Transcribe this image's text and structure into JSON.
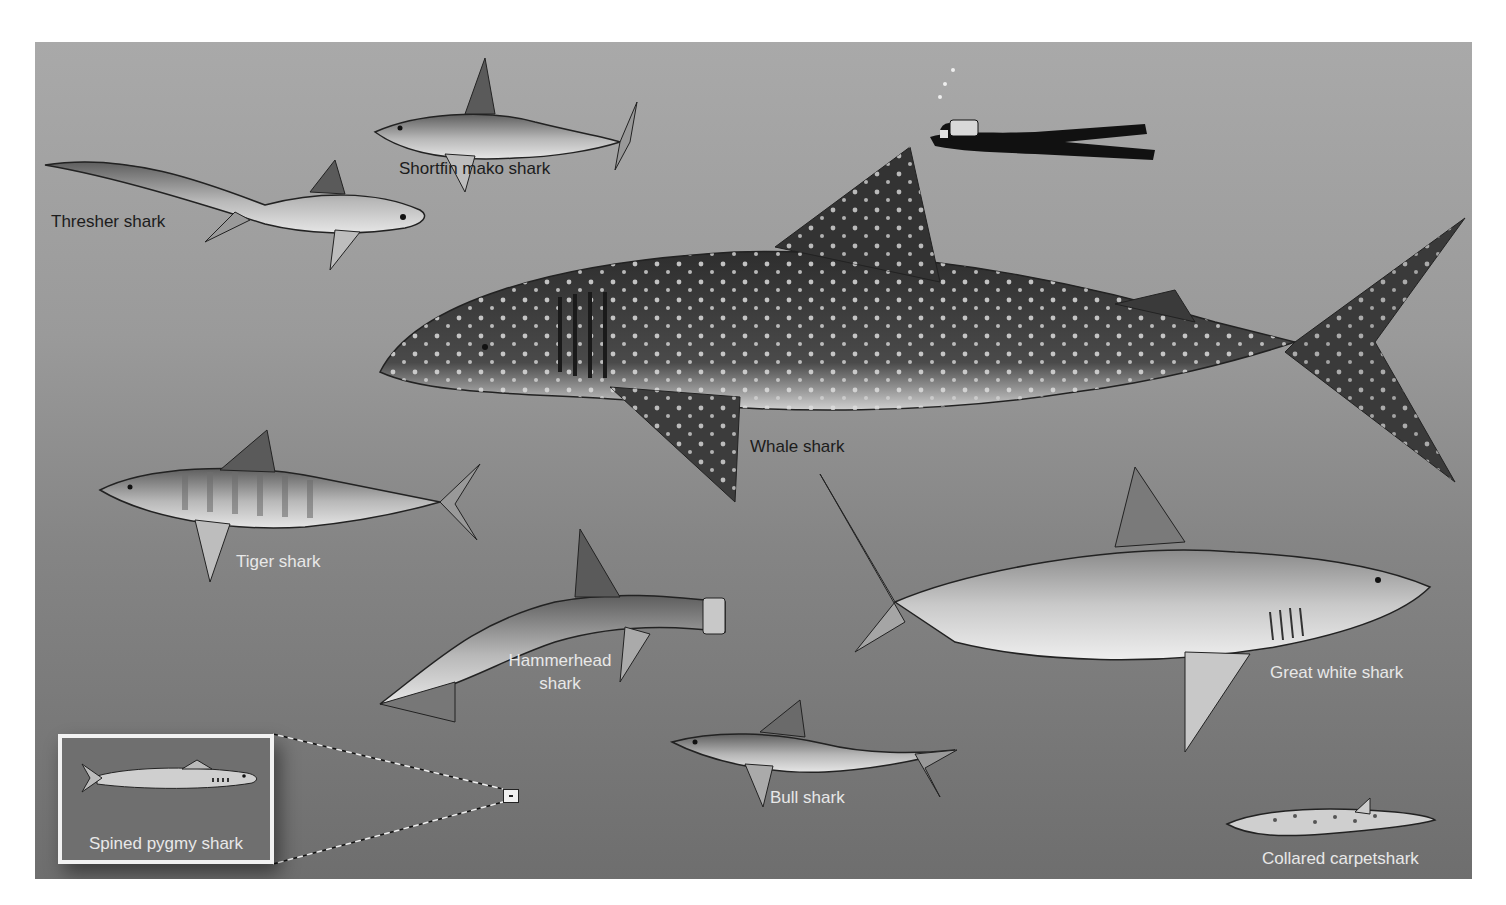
{
  "figure": {
    "background_top": "#a9a9a9",
    "background_bottom": "#6e6e6e",
    "label_dark": "#1c1c1c",
    "label_light": "#e8e8e8"
  },
  "labels": {
    "thresher": "Thresher shark",
    "mako": "Shortfin mako shark",
    "whale": "Whale shark",
    "tiger": "Tiger shark",
    "hammerhead_line1": "Hammerhead",
    "hammerhead_line2": "shark",
    "great_white": "Great white shark",
    "bull": "Bull shark",
    "pygmy": "Spined pygmy shark",
    "carpet": "Collared carpetshark"
  },
  "icons": {
    "diver": "scuba-diver-silhouette",
    "zoom_marker": "magnify-inset-marker"
  }
}
